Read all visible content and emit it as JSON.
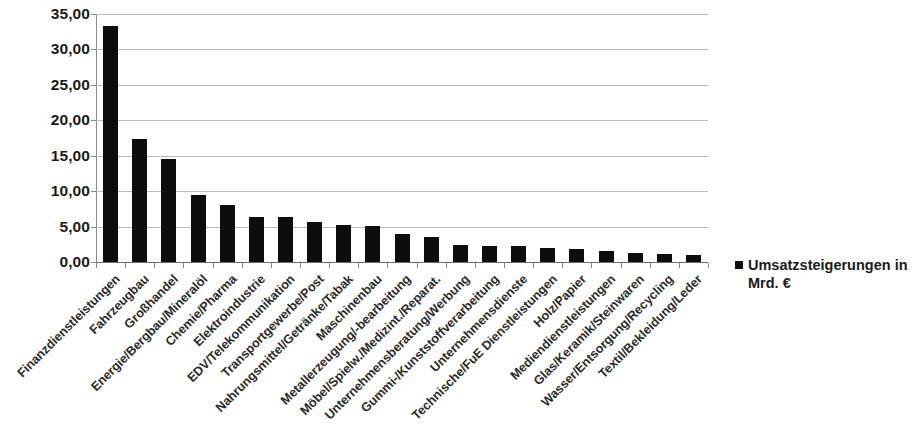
{
  "chart_data": {
    "type": "bar",
    "title": "",
    "subtitle": "",
    "xlabel": "",
    "ylabel": "",
    "ylim": [
      0,
      35
    ],
    "ytick_step": 5,
    "grid": true,
    "legend_position": "right",
    "bar_color": "#0d0d0d",
    "grid_color": "#b9b9b9",
    "axis_color": "#8a8a8a",
    "decimal_separator": ",",
    "ytick_labels": [
      "0,00",
      "5,00",
      "10,00",
      "15,00",
      "20,00",
      "25,00",
      "30,00",
      "35,00"
    ],
    "ytick_values": [
      0,
      5,
      10,
      15,
      20,
      25,
      30,
      35
    ],
    "legend": [
      "Umsatzsteigerungen in Mrd. €"
    ],
    "categories": [
      "Finanzdienstleistungen",
      "Fahrzeugbau",
      "Großhandel",
      "Energie/Bergbau/Mineralöl",
      "Chemie/Pharma",
      "Elektroindustrie",
      "EDV/Telekommunikation",
      "Transportgewerbe/Post",
      "Nahrungsmittel/Getränke/Tabak",
      "Maschinenbau",
      "Metallerzeugung/-bearbeitung",
      "Möbel/Spielw./Medizint./Reparat.",
      "Unternehmensberatung/Werbung",
      "Gummi-/Kunststoffverarbeitung",
      "Unternehmensdienste",
      "Technische/FuE Dienstleistungen",
      "Holz/Papier",
      "Mediendienstleistungen",
      "Glas/Keramik/Steinwaren",
      "Wasser/Entsorgung/Recycling",
      "Textil/Bekleidung/Leder"
    ],
    "values": [
      33.3,
      17.4,
      14.5,
      9.4,
      8.0,
      6.4,
      6.3,
      5.6,
      5.2,
      5.1,
      3.9,
      3.5,
      2.4,
      2.3,
      2.2,
      2.0,
      1.8,
      1.6,
      1.3,
      1.1,
      1.0
    ],
    "series": [
      {
        "name": "Umsatzsteigerungen in Mrd. €",
        "values": [
          33.3,
          17.4,
          14.5,
          9.4,
          8.0,
          6.4,
          6.3,
          5.6,
          5.2,
          5.1,
          3.9,
          3.5,
          2.4,
          2.3,
          2.2,
          2.0,
          1.8,
          1.6,
          1.3,
          1.1,
          1.0
        ]
      }
    ]
  },
  "legend": {
    "entry_label": "Umsatzsteigerungen in Mrd. €",
    "marker": "square-marker"
  }
}
